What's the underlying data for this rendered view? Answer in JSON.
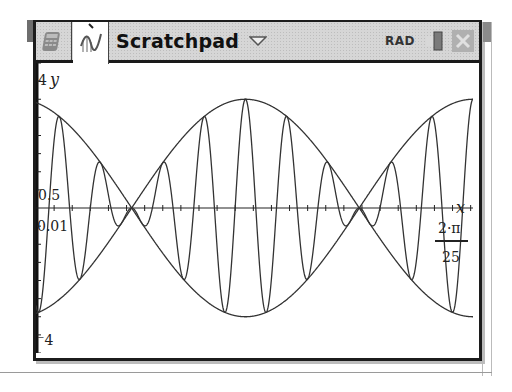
{
  "toolbar": {
    "tabs": [
      {
        "id": "calculator",
        "icon": "calculator-icon",
        "active": false
      },
      {
        "id": "graphs",
        "icon": "graph-icon",
        "active": true
      }
    ],
    "document_title": "Scratchpad",
    "dropdown_icon": "triangle-down-icon",
    "angle_mode": "RAD",
    "battery_icon": "battery-icon",
    "close_icon": "close-icon"
  },
  "graph": {
    "window": {
      "xmin": 0.01,
      "xmax_label_num": "2·π",
      "xmax_label_den": "25",
      "xmax": 0.2513,
      "ymin": -4,
      "ymax": 4,
      "xscl": 0.01,
      "yscl": 0.5
    },
    "labels": {
      "ymax": "4",
      "ymin": "⁻4",
      "yscl": "0.5",
      "xmin": "0.01",
      "x_axis": "x",
      "y_axis": "y"
    },
    "functions": [
      {
        "name": "f1",
        "expr": "3·cos(25·x)",
        "amp": 3,
        "k_env": 25,
        "k_car": 0
      },
      {
        "name": "f2",
        "expr": "-3·cos(25·x)",
        "amp": -3,
        "k_env": 25,
        "k_car": 0
      },
      {
        "name": "f3",
        "expr": "3·cos(25·x)·cos(275·x)",
        "amp": 3,
        "k_env": 25,
        "k_car": 275
      }
    ]
  }
}
